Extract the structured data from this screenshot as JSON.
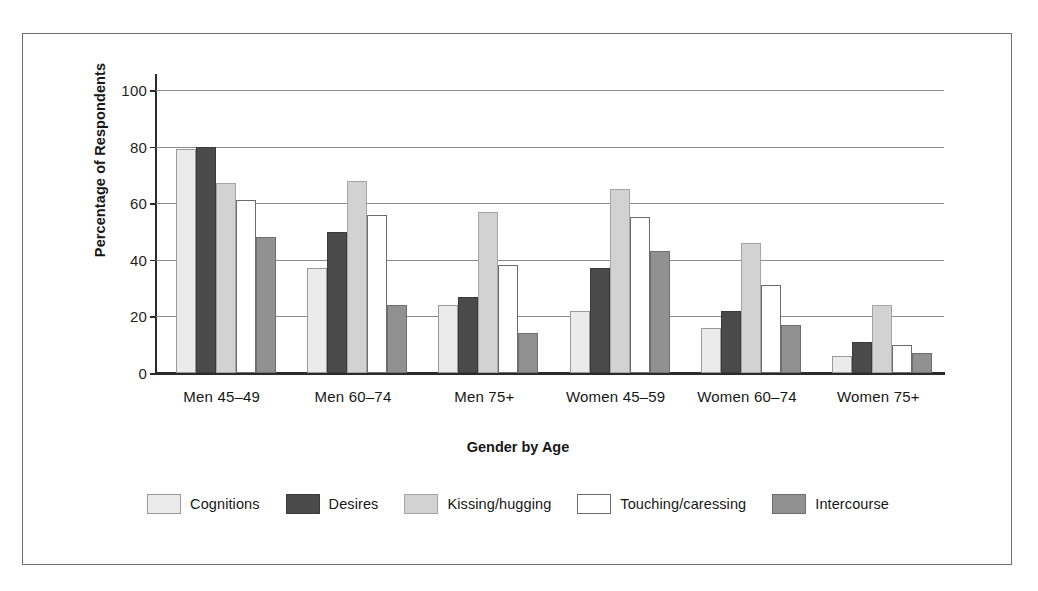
{
  "chart_data": {
    "type": "bar",
    "title": "",
    "xlabel": "Gender by Age",
    "ylabel": "Percentage of Respondents",
    "ylim": [
      0,
      100
    ],
    "yticks": [
      0,
      20,
      40,
      60,
      80,
      100
    ],
    "ytick_labels": [
      "0",
      "20",
      "40",
      "60",
      "80",
      "100"
    ],
    "grid": true,
    "grid_axis": "y",
    "legend_position": "bottom",
    "categories": [
      "Men 45–49",
      "Men 60–74",
      "Men 75+",
      "Women 45–59",
      "Women 60–74",
      "Women 75+"
    ],
    "series": [
      {
        "name": "Cognitions",
        "color": "#ebebeb",
        "values": [
          79,
          37,
          24,
          22,
          16,
          6
        ]
      },
      {
        "name": "Desires",
        "color": "#4a4a4a",
        "values": [
          80,
          50,
          27,
          37,
          22,
          11
        ]
      },
      {
        "name": "Kissing/hugging",
        "color": "#d2d2d2",
        "values": [
          67,
          68,
          57,
          65,
          46,
          24
        ]
      },
      {
        "name": "Touching/caressing",
        "color": "#ffffff",
        "values": [
          61,
          56,
          38,
          55,
          31,
          10
        ]
      },
      {
        "name": "Intercourse",
        "color": "#919191",
        "values": [
          48,
          24,
          14,
          43,
          17,
          7
        ]
      }
    ]
  },
  "axis": {
    "y_title": "Percentage of Respondents",
    "x_title": "Gender by Age",
    "y_tick_0": "0",
    "y_tick_1": "20",
    "y_tick_2": "40",
    "y_tick_3": "60",
    "y_tick_4": "80",
    "y_tick_5": "100"
  },
  "legend": {
    "items": [
      {
        "label": "Cognitions"
      },
      {
        "label": "Desires"
      },
      {
        "label": "Kissing/hugging"
      },
      {
        "label": "Touching/caressing"
      },
      {
        "label": "Intercourse"
      }
    ]
  }
}
